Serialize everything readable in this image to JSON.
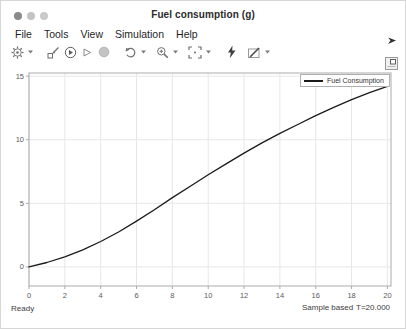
{
  "window": {
    "title": "Fuel consumption (g)",
    "status_left": "Ready",
    "status_sample": "Sample based",
    "status_time": "T=20.000"
  },
  "menu": {
    "items": [
      "File",
      "Tools",
      "View",
      "Simulation",
      "Help"
    ]
  },
  "toolbar": {
    "icons": [
      "settings-gear",
      "highlight-block",
      "run",
      "step-forward",
      "stop",
      "restore-view",
      "zoom",
      "span",
      "trigger",
      "measurements"
    ]
  },
  "legend": {
    "label": "Fuel Consumption"
  },
  "colors": {
    "curve": "#1a1a1a",
    "grid": "#e7e7e7",
    "axis": "#ababab",
    "tick_text": "#5a5a5a",
    "icon": "#6e6e6e",
    "icon_dark": "#3f3f3f",
    "icon_disabled": "#c4c4c4"
  },
  "chart_data": {
    "type": "line",
    "title": "Fuel consumption (g)",
    "xlabel": "",
    "ylabel": "",
    "xlim": [
      0,
      20.2
    ],
    "ylim": [
      -1.5,
      15.25
    ],
    "xticks": [
      0,
      2,
      4,
      6,
      8,
      10,
      12,
      14,
      16,
      18,
      20
    ],
    "yticks": [
      0,
      5,
      10,
      15
    ],
    "grid": true,
    "legend_position": "top-right",
    "series": [
      {
        "name": "Fuel Consumption",
        "x": [
          0,
          1,
          2,
          3,
          4,
          5,
          6,
          7,
          8,
          9,
          10,
          11,
          12,
          13,
          14,
          15,
          16,
          17,
          18,
          19,
          20
        ],
        "values": [
          0.0,
          0.35,
          0.8,
          1.35,
          2.0,
          2.75,
          3.6,
          4.5,
          5.45,
          6.35,
          7.25,
          8.1,
          8.95,
          9.75,
          10.5,
          11.2,
          11.9,
          12.55,
          13.15,
          13.7,
          14.2
        ]
      }
    ]
  }
}
